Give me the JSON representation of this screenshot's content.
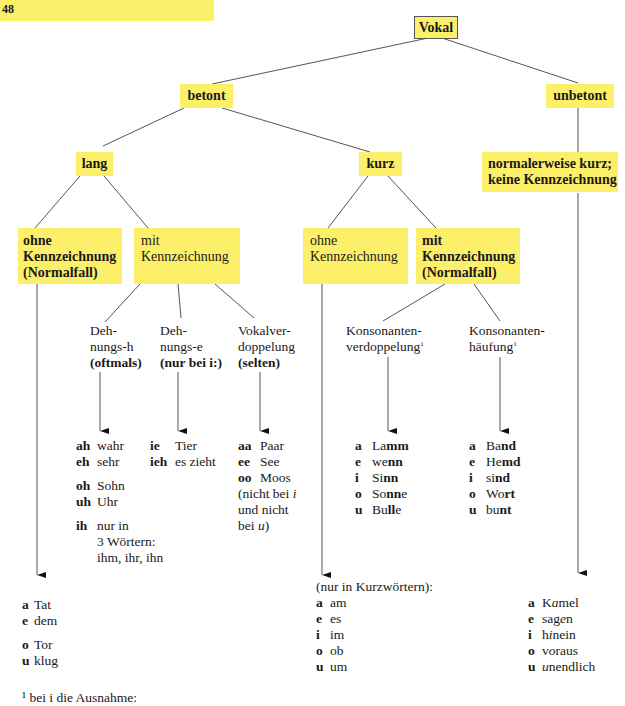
{
  "page": {
    "number": "48",
    "bar_color": "#fcf06a",
    "box_color": "#fcf06a"
  },
  "nodes": {
    "vokal": "Vokal",
    "betont": "betont",
    "unbetont": "unbetont",
    "lang": "lang",
    "kurz": "kurz",
    "unbetont_child": {
      "line1": "normalerweise kurz;",
      "line2": "keine Kennzeichnung"
    },
    "lang_ohne": {
      "line1": "ohne",
      "line2": "Kennzeichnung",
      "line3": "(Normalfall)"
    },
    "lang_mit": {
      "line1": "mit",
      "line2": "Kennzeichnung"
    },
    "kurz_ohne": {
      "line1": "ohne",
      "line2": "Kennzeichnung"
    },
    "kurz_mit": {
      "line1": "mit",
      "line2": "Kennzeichnung",
      "line3": "(Normalfall)"
    },
    "dehnungs_h": {
      "line1": "Deh-",
      "line2": "nungs-h",
      "line3": "(oftmals)"
    },
    "dehnungs_e": {
      "line1": "Deh-",
      "line2": "nungs-e",
      "line3": "(nur bei i:)"
    },
    "vokalverdopplung": {
      "line1": "Vokalver-",
      "line2": "doppelung",
      "line3": "(selten)"
    },
    "konsonantenverdopplung": {
      "line1": "Konsonanten-",
      "line2": "verdoppelung",
      "sup": "1"
    },
    "konsonantenhaeufung": {
      "line1": "Konsonanten-",
      "line2": "häufung",
      "sup": "1"
    }
  },
  "examples": {
    "dehnungs_h": [
      {
        "key": "ah",
        "word": "wahr"
      },
      {
        "key": "eh",
        "word": "sehr"
      },
      {
        "key": "oh",
        "word": "Sohn"
      },
      {
        "key": "uh",
        "word": "Uhr"
      },
      {
        "key": "ih",
        "word": "nur in",
        "extra1": "3 Wörtern:",
        "extra2": "ihm, ihr, ihn"
      }
    ],
    "dehnungs_e": [
      {
        "key": "ie",
        "word": "Tier"
      },
      {
        "key": "ieh",
        "word": "es zieht"
      }
    ],
    "vokalverdopplung": [
      {
        "key": "aa",
        "word": "Paar"
      },
      {
        "key": "ee",
        "word": "See"
      },
      {
        "key": "oo",
        "word": "Moos"
      }
    ],
    "vokalverdopplung_note": {
      "line1": "(nicht bei ",
      "i": "i",
      "line2": "und nicht",
      "line3": "bei ",
      "u": "u",
      "close": ")"
    },
    "konsonantenverdopplung": [
      {
        "key": "a",
        "pre": "La",
        "bold": "mm",
        "post": ""
      },
      {
        "key": "e",
        "pre": "we",
        "bold": "nn",
        "post": ""
      },
      {
        "key": "i",
        "pre": "Si",
        "bold": "nn",
        "post": ""
      },
      {
        "key": "o",
        "pre": "So",
        "bold": "nn",
        "post": "e"
      },
      {
        "key": "u",
        "pre": "Bu",
        "bold": "ll",
        "post": "e"
      }
    ],
    "konsonantenhaeufung": [
      {
        "key": "a",
        "pre": "Ba",
        "bold": "nd",
        "post": ""
      },
      {
        "key": "e",
        "pre": "He",
        "bold": "md",
        "post": ""
      },
      {
        "key": "i",
        "pre": "si",
        "bold": "nd",
        "post": ""
      },
      {
        "key": "o",
        "pre": "Wo",
        "bold": "rt",
        "post": ""
      },
      {
        "key": "u",
        "pre": "bu",
        "bold": "nt",
        "post": ""
      }
    ],
    "lang_ohne": [
      {
        "key": "a",
        "word": "Tat"
      },
      {
        "key": "e",
        "word": "dem"
      },
      {
        "key": "o",
        "word": "Tor"
      },
      {
        "key": "u",
        "word": "klug"
      }
    ],
    "kurz_ohne_heading": "(nur in Kurzwörtern):",
    "kurz_ohne": [
      {
        "key": "a",
        "word": "am"
      },
      {
        "key": "e",
        "word": "es"
      },
      {
        "key": "i",
        "word": "im"
      },
      {
        "key": "o",
        "word": "ob"
      },
      {
        "key": "u",
        "word": "um"
      }
    ],
    "unbetont": [
      {
        "key": "a",
        "pre": "K",
        "it": "a",
        "post": "mel"
      },
      {
        "key": "e",
        "pre": "sag",
        "it": "e",
        "post": "n"
      },
      {
        "key": "i",
        "pre": "h",
        "it": "i",
        "post": "nein"
      },
      {
        "key": "o",
        "pre": "v",
        "it": "o",
        "post": "raus"
      },
      {
        "key": "u",
        "pre": "",
        "it": "u",
        "post": "nendlich"
      }
    ]
  },
  "footnote": "¹ bei i die Ausnahme:"
}
